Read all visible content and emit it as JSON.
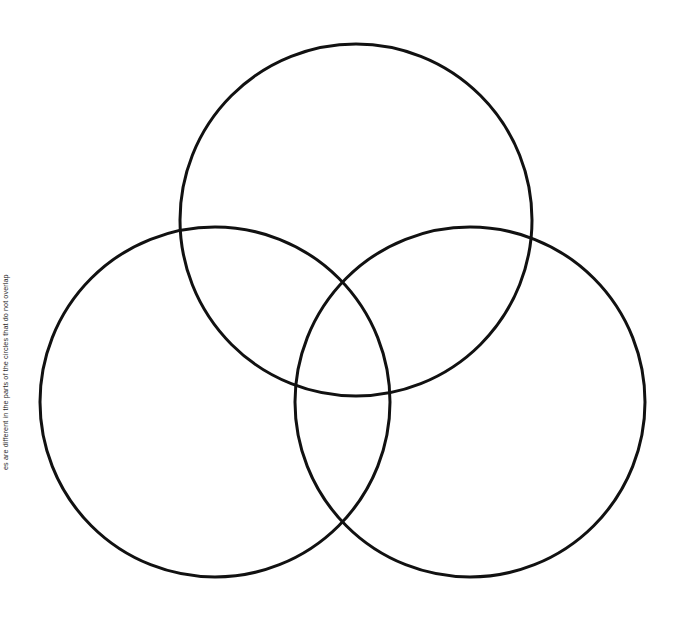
{
  "page": {
    "background_color": "#ffffff",
    "width": 684,
    "height": 618
  },
  "caption": {
    "text": "es are different in the parts of the circles that do not overlap"
  },
  "diagram": {
    "type": "venn",
    "stroke_color": "#111111",
    "stroke_width": 3,
    "fill": "none",
    "circle_count": 3,
    "circles": [
      {
        "label": "top-circle",
        "cx": 356,
        "cy": 220,
        "r": 176
      },
      {
        "label": "left-circle",
        "cx": 215,
        "cy": 402,
        "r": 175
      },
      {
        "label": "right-circle",
        "cx": 470,
        "cy": 402,
        "r": 175
      }
    ]
  }
}
